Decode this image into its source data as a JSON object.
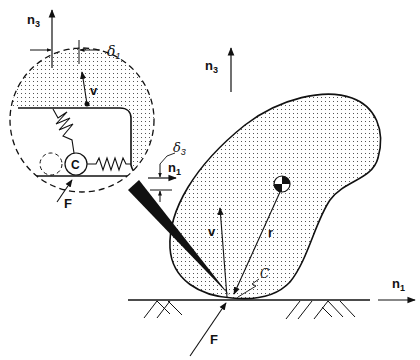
{
  "figure": {
    "type": "mechanics-diagram",
    "colors": {
      "ink": "#111111",
      "background": "#ffffff",
      "stipple": "#555555"
    }
  },
  "main": {
    "axis_n3": {
      "base": "n",
      "sub": "3"
    },
    "axis_n1": {
      "base": "n",
      "sub": "1"
    },
    "velocity_label": "v",
    "position_label": "r",
    "contact_label": "C",
    "force_label": "F",
    "center_of_mass_icon": "center-of-mass-symbol"
  },
  "inset": {
    "axis_n3": {
      "base": "n",
      "sub": "3"
    },
    "axis_n1": {
      "base": "n",
      "sub": "1"
    },
    "delta1": {
      "base": "δ",
      "sub": "1"
    },
    "delta3": {
      "base": "δ",
      "sub": "3"
    },
    "velocity_label": "v",
    "contact_label": "C",
    "force_label": "F"
  }
}
